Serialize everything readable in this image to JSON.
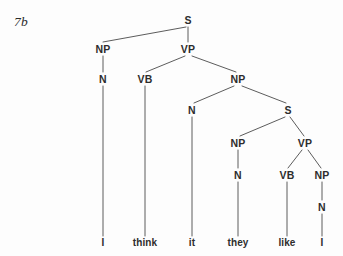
{
  "figure": {
    "example_label": "7b",
    "background_color": "#fdfdfd",
    "line_color": "#4a4a4a",
    "text_color": "#2d2d2d",
    "width": 343,
    "height": 256
  },
  "tree": {
    "sentence": "I think it they like I",
    "nodes": [
      {
        "id": "n0",
        "label": "S",
        "x": 188,
        "y": 20
      },
      {
        "id": "n1",
        "label": "NP",
        "x": 103,
        "y": 49
      },
      {
        "id": "n2",
        "label": "VP",
        "x": 188,
        "y": 49
      },
      {
        "id": "n3",
        "label": "N",
        "x": 103,
        "y": 79
      },
      {
        "id": "n4",
        "label": "VB",
        "x": 145,
        "y": 79
      },
      {
        "id": "n5",
        "label": "NP",
        "x": 238,
        "y": 79
      },
      {
        "id": "n6",
        "label": "N",
        "x": 192,
        "y": 110
      },
      {
        "id": "n7",
        "label": "S",
        "x": 288,
        "y": 110
      },
      {
        "id": "n8",
        "label": "NP",
        "x": 238,
        "y": 143
      },
      {
        "id": "n9",
        "label": "VP",
        "x": 305,
        "y": 143
      },
      {
        "id": "n10",
        "label": "N",
        "x": 238,
        "y": 175
      },
      {
        "id": "n11",
        "label": "VB",
        "x": 287,
        "y": 175
      },
      {
        "id": "n12",
        "label": "NP",
        "x": 322,
        "y": 175
      },
      {
        "id": "n13",
        "label": "N",
        "x": 322,
        "y": 207
      }
    ],
    "terminals": [
      {
        "id": "t0",
        "label": "I",
        "x": 103,
        "y": 243
      },
      {
        "id": "t1",
        "label": "think",
        "x": 145,
        "y": 243
      },
      {
        "id": "t2",
        "label": "it",
        "x": 192,
        "y": 243
      },
      {
        "id": "t3",
        "label": "they",
        "x": 238,
        "y": 243
      },
      {
        "id": "t4",
        "label": "like",
        "x": 287,
        "y": 243
      },
      {
        "id": "t5",
        "label": "I",
        "x": 322,
        "y": 243
      }
    ],
    "edges": [
      {
        "from": "n0",
        "to": "n1",
        "x1": 186,
        "y1": 27,
        "x2": 103,
        "y2": 42
      },
      {
        "from": "n0",
        "to": "n2",
        "x1": 188,
        "y1": 27,
        "x2": 188,
        "y2": 42
      },
      {
        "from": "n1",
        "to": "n3",
        "x1": 103,
        "y1": 56,
        "x2": 103,
        "y2": 72
      },
      {
        "from": "n2",
        "to": "n4",
        "x1": 185,
        "y1": 56,
        "x2": 146,
        "y2": 72
      },
      {
        "from": "n2",
        "to": "n5",
        "x1": 192,
        "y1": 56,
        "x2": 236,
        "y2": 72
      },
      {
        "from": "n3",
        "to": "t0",
        "x1": 103,
        "y1": 86,
        "x2": 103,
        "y2": 236
      },
      {
        "from": "n4",
        "to": "t1",
        "x1": 145,
        "y1": 86,
        "x2": 145,
        "y2": 236
      },
      {
        "from": "n5",
        "to": "n6",
        "x1": 234,
        "y1": 86,
        "x2": 194,
        "y2": 103
      },
      {
        "from": "n5",
        "to": "n7",
        "x1": 242,
        "y1": 86,
        "x2": 286,
        "y2": 103
      },
      {
        "from": "n6",
        "to": "t2",
        "x1": 192,
        "y1": 117,
        "x2": 192,
        "y2": 236
      },
      {
        "from": "n7",
        "to": "n8",
        "x1": 285,
        "y1": 117,
        "x2": 240,
        "y2": 136
      },
      {
        "from": "n7",
        "to": "n9",
        "x1": 290,
        "y1": 117,
        "x2": 304,
        "y2": 136
      },
      {
        "from": "n8",
        "to": "n10",
        "x1": 238,
        "y1": 150,
        "x2": 238,
        "y2": 168
      },
      {
        "from": "n9",
        "to": "n11",
        "x1": 302,
        "y1": 150,
        "x2": 288,
        "y2": 168
      },
      {
        "from": "n9",
        "to": "n12",
        "x1": 308,
        "y1": 150,
        "x2": 321,
        "y2": 168
      },
      {
        "from": "n10",
        "to": "t3",
        "x1": 238,
        "y1": 182,
        "x2": 238,
        "y2": 236
      },
      {
        "from": "n11",
        "to": "t4",
        "x1": 287,
        "y1": 182,
        "x2": 287,
        "y2": 236
      },
      {
        "from": "n12",
        "to": "n13",
        "x1": 322,
        "y1": 182,
        "x2": 322,
        "y2": 200
      },
      {
        "from": "n13",
        "to": "t5",
        "x1": 322,
        "y1": 214,
        "x2": 322,
        "y2": 236
      }
    ]
  }
}
